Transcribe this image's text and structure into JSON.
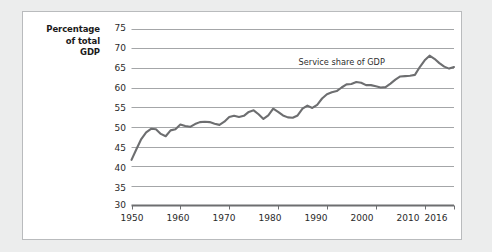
{
  "chart_data": {
    "type": "line",
    "title": "",
    "xlabel": "",
    "ylabel": "Percentage of total GDP",
    "ylabel_lines": [
      "Percentage",
      "of total",
      "GDP"
    ],
    "xlim": [
      1950,
      2016
    ],
    "ylim": [
      30,
      75
    ],
    "y_ticks": [
      30,
      35,
      40,
      45,
      50,
      55,
      60,
      65,
      70,
      75
    ],
    "x_ticks": [
      1950,
      1960,
      1970,
      1980,
      1990,
      2000,
      2010,
      2016
    ],
    "grid": "horizontal",
    "legend": "none",
    "annotations": [
      {
        "text": "Service share of GDP",
        "x": 1993,
        "y": 66.6
      }
    ],
    "series": [
      {
        "name": "Service share of GDP",
        "color": "#6d6e70",
        "x": [
          1950,
          1951,
          1952,
          1953,
          1954,
          1955,
          1956,
          1957,
          1958,
          1959,
          1960,
          1961,
          1962,
          1963,
          1964,
          1965,
          1966,
          1967,
          1968,
          1969,
          1970,
          1971,
          1972,
          1973,
          1974,
          1975,
          1976,
          1977,
          1978,
          1979,
          1980,
          1981,
          1982,
          1983,
          1984,
          1985,
          1986,
          1987,
          1988,
          1989,
          1990,
          1991,
          1992,
          1993,
          1994,
          1995,
          1996,
          1997,
          1998,
          1999,
          2000,
          2001,
          2002,
          2003,
          2004,
          2005,
          2006,
          2007,
          2008,
          2009,
          2010,
          2011,
          2012,
          2013,
          2014,
          2015,
          2016
        ],
        "values": [
          41.6,
          44.3,
          46.9,
          48.6,
          49.5,
          49.4,
          48.2,
          47.6,
          49.1,
          49.4,
          50.6,
          50.2,
          50.0,
          50.7,
          51.2,
          51.3,
          51.2,
          50.8,
          50.5,
          51.3,
          52.5,
          52.8,
          52.5,
          52.8,
          53.8,
          54.2,
          53.2,
          52.0,
          52.9,
          54.6,
          53.8,
          52.9,
          52.4,
          52.3,
          52.9,
          54.6,
          55.4,
          54.8,
          55.6,
          57.2,
          58.3,
          58.8,
          59.1,
          60.0,
          60.8,
          60.9,
          61.4,
          61.2,
          60.6,
          60.6,
          60.3,
          60.0,
          60.1,
          61.0,
          62.0,
          62.8,
          62.9,
          63.0,
          63.2,
          65.2,
          66.9,
          68.1,
          67.3,
          66.2,
          65.3,
          64.8,
          65.2
        ]
      }
    ]
  },
  "colors": {
    "page_background": "#eceded",
    "panel_background": "#ffffff",
    "panel_border": "#b9bbbd",
    "gridline": "#9a9c9e",
    "axis": "#6d6e70",
    "series": "#6d6e70",
    "tick_text": "#2a2a2a",
    "axis_title_text": "#1b1b1b"
  }
}
